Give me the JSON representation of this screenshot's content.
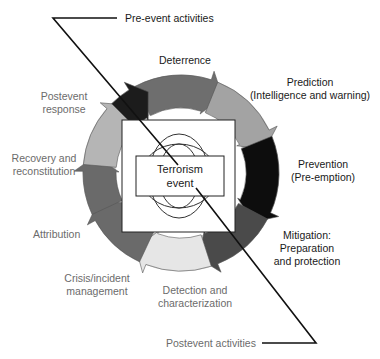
{
  "diagram": {
    "center": {
      "line1": "Terrorism",
      "line2": "event"
    },
    "phases": {
      "pre_event": "Pre-event activities",
      "post_event": "Postevent activities"
    },
    "activities": [
      {
        "id": "deterrence",
        "lines": [
          "Deterrence"
        ],
        "shade": "#6e6e6e",
        "label_color": "#1a1a1a"
      },
      {
        "id": "prediction",
        "lines": [
          "Prediction",
          "(Intelligence and warning)"
        ],
        "shade": "#a3a3a3",
        "label_color": "#1a1a1a"
      },
      {
        "id": "prevention",
        "lines": [
          "Prevention",
          "(Pre-emption)"
        ],
        "shade": "#0d0d0d",
        "label_color": "#1a1a1a"
      },
      {
        "id": "mitigation",
        "lines": [
          "Mitigation:",
          "Preparation",
          "and protection"
        ],
        "shade": "#4a4a4a",
        "label_color": "#1a1a1a"
      },
      {
        "id": "detection",
        "lines": [
          "Detection and",
          "characterization"
        ],
        "shade": "#e6e6e6",
        "label_color": "#6b6b6b"
      },
      {
        "id": "crisis",
        "lines": [
          "Crisis/incident",
          "management"
        ],
        "shade": "#6a6a6a",
        "label_color": "#6b6b6b"
      },
      {
        "id": "attribution",
        "lines": [
          "Attribution"
        ],
        "shade": "#6a6a6a",
        "label_color": "#6b6b6b"
      },
      {
        "id": "recovery",
        "lines": [
          "Recovery and",
          "reconstitution"
        ],
        "shade": "#b5b5b5",
        "label_color": "#6b6b6b"
      },
      {
        "id": "postevent_response",
        "lines": [
          "Postevent",
          "response"
        ],
        "shade": "#1c1c1c",
        "label_color": "#6b6b6b"
      }
    ]
  }
}
